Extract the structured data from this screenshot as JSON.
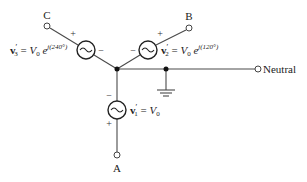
{
  "diagram": {
    "terminals": {
      "A": "A",
      "B": "B",
      "C": "C",
      "neutral": "Neutral"
    },
    "sources": [
      {
        "id": "v1",
        "phase": "A",
        "label_main": "v",
        "label_sup": "′",
        "label_sub": "1",
        "equals": " = ",
        "V": "V",
        "V_sub": "0",
        "exp": "",
        "plus": "+",
        "minus": "−"
      },
      {
        "id": "v2",
        "phase": "B",
        "label_main": "v",
        "label_sup": "′",
        "label_sub": "2",
        "equals": " = ",
        "V": "V",
        "V_sub": "0",
        "e": " e",
        "exp": "j(120°)",
        "plus": "+",
        "minus": "−"
      },
      {
        "id": "v3",
        "phase": "C",
        "label_main": "v",
        "label_sup": "′",
        "label_sub": "3",
        "equals": " = ",
        "V": "V",
        "V_sub": "0",
        "e": " e",
        "exp": "j(240°)",
        "plus": "+",
        "minus": "−"
      }
    ],
    "icons": {
      "source": "ac-source-icon",
      "ground": "ground-icon",
      "terminal": "terminal-icon",
      "node": "junction-dot"
    }
  }
}
